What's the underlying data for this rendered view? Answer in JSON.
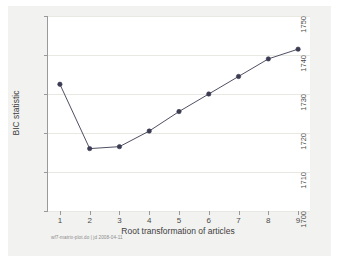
{
  "chart_data": {
    "type": "line",
    "title": "",
    "subtitle": "",
    "xlabel": "Root transformation of articles",
    "ylabel": "BIC statistic",
    "x": [
      1,
      2,
      3,
      4,
      5,
      6,
      7,
      8,
      9
    ],
    "values": [
      1732.5,
      1716.0,
      1716.5,
      1720.5,
      1725.5,
      1730.0,
      1734.5,
      1739.0,
      1741.5
    ],
    "series": [
      {
        "name": "BIC statistic",
        "values": [
          1732.5,
          1716.0,
          1716.5,
          1720.5,
          1725.5,
          1730.0,
          1734.5,
          1739.0,
          1741.5
        ]
      }
    ],
    "xlim": [
      0.6,
      9.4
    ],
    "ylim": [
      1700,
      1750
    ],
    "xticks": [
      1,
      2,
      3,
      4,
      5,
      6,
      7,
      8,
      9
    ],
    "xticklabels": [
      "1",
      "2",
      "3",
      "4",
      "5",
      "6",
      "7",
      "8",
      "9"
    ],
    "yticks": [
      1700,
      1710,
      1720,
      1730,
      1740,
      1750
    ],
    "yticklabels": [
      "1700",
      "1710",
      "1720",
      "1730",
      "1740",
      "1750"
    ],
    "grid": "horizontal",
    "legend": "none",
    "marker": "circle",
    "line_color": "#3b3b52",
    "marker_color": "#3b3b52",
    "grid_color": "#e9e9e4",
    "plot_background": "#ffffff",
    "graph_background": "#f2f2f0",
    "note": "wf7-matrix-plot.do | jd 2008-04-11"
  }
}
